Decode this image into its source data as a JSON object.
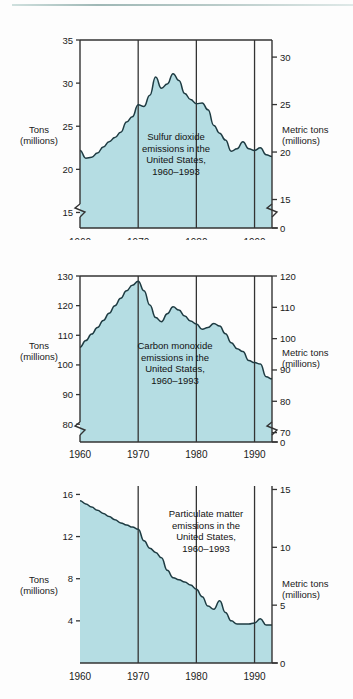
{
  "document": {
    "type": "figure-sheet",
    "background_color": "#fdfdfd",
    "top_rule_color": "#b9cbc9"
  },
  "style": {
    "fill_color": "#b5dde3",
    "line_color": "#1e3b42",
    "axis_color": "#333333",
    "text_color": "#1a1a1a"
  },
  "panels": [
    {
      "id": "sulfur-dioxide",
      "caption": "Sulfur dioxide\nemissions in the\nUnited States,\n1960–1993",
      "left_axis_title": "Tons\n(millions)",
      "right_axis_title": "Metric tons\n(millions)"
    },
    {
      "id": "carbon-monoxide",
      "caption": "Carbon monoxide\nemissions in the\nUnited States,\n1960–1993",
      "left_axis_title": "Tons\n(millions)",
      "right_axis_title": "Metric tons\n(millions)"
    },
    {
      "id": "particulate-matter",
      "caption": "Particulate matter\nemissions in the\nUnited States,\n1960–1993",
      "left_axis_title": "Tons\n(millions)",
      "right_axis_title": "Metric tons\n(millions)"
    }
  ],
  "chart_data": [
    {
      "type": "area",
      "id": "sulfur-dioxide",
      "title": "Sulfur dioxide emissions in the United States, 1960–1993",
      "xlabel": "",
      "ylabel": "Tons (millions)",
      "ylabel_right": "Metric tons (millions)",
      "xlim": [
        1960,
        1993
      ],
      "ylim": [
        13.2,
        35
      ],
      "ylim_right": [
        12,
        31.8
      ],
      "yticks": [
        15,
        20,
        25,
        30,
        35
      ],
      "yticks_right": [
        0,
        15,
        20,
        25,
        30
      ],
      "xticks": [
        1960,
        1970,
        1980,
        1990
      ],
      "axis_break": true,
      "axis_break_note": "y-axis broken below 15 (left) / below 15 (right, jumps to 0)",
      "grid": "vertical-only",
      "legend": "none",
      "x": [
        1960,
        1961,
        1962,
        1963,
        1964,
        1965,
        1966,
        1967,
        1968,
        1969,
        1970,
        1971,
        1972,
        1973,
        1974,
        1975,
        1976,
        1977,
        1978,
        1979,
        1980,
        1981,
        1982,
        1983,
        1984,
        1985,
        1986,
        1987,
        1988,
        1989,
        1990,
        1991,
        1992,
        1993
      ],
      "values": [
        22.2,
        21.3,
        21.4,
        21.9,
        22.6,
        23.2,
        23.7,
        24.3,
        25.5,
        26.1,
        27.5,
        27.3,
        28.6,
        30.7,
        29.4,
        29.9,
        31.1,
        30.3,
        28.8,
        28.1,
        27.6,
        27.7,
        26.9,
        25.1,
        24.2,
        23.4,
        22.1,
        22.4,
        23.2,
        22.4,
        22.2,
        22.5,
        21.7,
        21.5,
        22.3
      ],
      "units": "million tons per year"
    },
    {
      "type": "area",
      "id": "carbon-monoxide",
      "title": "Carbon monoxide emissions in the United States, 1960–1993",
      "xlabel": "",
      "ylabel": "Tons (millions)",
      "ylabel_right": "Metric tons (millions)",
      "xlim": [
        1960,
        1993
      ],
      "ylim": [
        74,
        130
      ],
      "ylim_right": [
        67,
        120
      ],
      "yticks": [
        80,
        90,
        100,
        110,
        120,
        130
      ],
      "yticks_right": [
        0,
        70,
        80,
        90,
        100,
        110,
        120
      ],
      "xticks": [
        1960,
        1970,
        1980,
        1990
      ],
      "axis_break": true,
      "axis_break_note": "y-axis broken below 80 (left) / below 70 (right, jumps to 0)",
      "grid": "vertical-only",
      "legend": "none",
      "x": [
        1960,
        1961,
        1962,
        1963,
        1964,
        1965,
        1966,
        1967,
        1968,
        1969,
        1970,
        1971,
        1972,
        1973,
        1974,
        1975,
        1976,
        1977,
        1978,
        1979,
        1980,
        1981,
        1982,
        1983,
        1984,
        1985,
        1986,
        1987,
        1988,
        1989,
        1990,
        1991,
        1992,
        1993
      ],
      "values": [
        106.0,
        108.2,
        110.4,
        112.6,
        115.0,
        117.4,
        120.0,
        122.5,
        125.0,
        126.9,
        128.2,
        125.0,
        120.2,
        116.0,
        114.6,
        117.3,
        119.6,
        118.5,
        116.5,
        114.8,
        113.8,
        112.0,
        112.6,
        114.0,
        113.1,
        110.5,
        107.5,
        105.5,
        104.5,
        101.5,
        100.8,
        100.3,
        96.0,
        95.3
      ],
      "units": "million tons per year"
    },
    {
      "type": "area",
      "id": "particulate-matter",
      "title": "Particulate matter emissions in the United States, 1960–1993",
      "xlabel": "",
      "ylabel": "Tons (millions)",
      "ylabel_right": "Metric tons (millions)",
      "xlim": [
        1960,
        1993
      ],
      "ylim": [
        0,
        16.8
      ],
      "ylim_right": [
        0,
        15.3
      ],
      "yticks": [
        4,
        8,
        12,
        16
      ],
      "yticks_right": [
        0,
        5,
        10,
        15
      ],
      "xticks": [
        1960,
        1970,
        1980,
        1990
      ],
      "axis_break": false,
      "grid": "vertical-only",
      "legend": "none",
      "x": [
        1960,
        1961,
        1962,
        1963,
        1964,
        1965,
        1966,
        1967,
        1968,
        1969,
        1970,
        1971,
        1972,
        1973,
        1974,
        1975,
        1976,
        1977,
        1978,
        1979,
        1980,
        1981,
        1982,
        1983,
        1984,
        1985,
        1986,
        1987,
        1988,
        1989,
        1990,
        1991,
        1992,
        1993
      ],
      "values": [
        15.4,
        15.1,
        14.8,
        14.5,
        14.2,
        13.9,
        13.6,
        13.3,
        13.1,
        12.9,
        12.7,
        11.6,
        10.9,
        10.5,
        10.0,
        8.8,
        8.1,
        7.9,
        7.7,
        7.4,
        7.0,
        6.3,
        5.4,
        5.1,
        5.9,
        4.8,
        4.0,
        3.7,
        3.7,
        3.7,
        3.8,
        4.2,
        3.6,
        3.6
      ],
      "units": "million tons per year"
    }
  ],
  "tick_text": {
    "p1_left": [
      "35",
      "30",
      "25",
      "20",
      "15"
    ],
    "p1_right": [
      "30",
      "25",
      "20",
      "15",
      "0"
    ],
    "p1_x": [
      "1960",
      "1970",
      "1980",
      "1990"
    ],
    "p2_left": [
      "130",
      "120",
      "110",
      "100",
      "90",
      "80"
    ],
    "p2_right": [
      "120",
      "110",
      "100",
      "90",
      "80",
      "70",
      "0"
    ],
    "p2_x": [
      "1960",
      "1970",
      "1980",
      "1990"
    ],
    "p3_left": [
      "16",
      "12",
      "8",
      "4"
    ],
    "p3_right": [
      "15",
      "10",
      "5",
      "0"
    ],
    "p3_x": [
      "1960",
      "1970",
      "1980",
      "1990"
    ]
  }
}
